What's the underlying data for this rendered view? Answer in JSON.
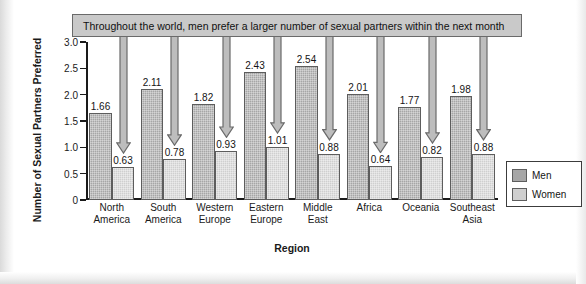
{
  "figure": {
    "callout_banner": "Throughout the world, men prefer a larger number of sexual partners within the next month",
    "legend_men": "Men",
    "legend_women": "Women"
  },
  "chart_data": {
    "type": "bar",
    "title": "Throughout the world, men prefer a larger number of sexual partners within the next month",
    "xlabel": "Region",
    "ylabel": "Number of Sexual Partners Preferred",
    "ylim": [
      0,
      3.0
    ],
    "yticks": [
      "0",
      "0.5",
      "1.0",
      "1.5",
      "2.0",
      "2.5",
      "3.0"
    ],
    "ytick_values": [
      0,
      0.5,
      1.0,
      1.5,
      2.0,
      2.5,
      3.0
    ],
    "grid": false,
    "legend_position": "right",
    "categories": [
      "North America",
      "South America",
      "Western Europe",
      "Eastern Europe",
      "Middle East",
      "Africa",
      "Oceania",
      "Southeast Asia"
    ],
    "category_lines": [
      [
        "North",
        "America"
      ],
      [
        "South",
        "America"
      ],
      [
        "Western",
        "Europe"
      ],
      [
        "Eastern",
        "Europe"
      ],
      [
        "Middle",
        "East"
      ],
      [
        "Africa",
        ""
      ],
      [
        "Oceania",
        ""
      ],
      [
        "Southeast",
        "Asia"
      ]
    ],
    "series": [
      {
        "name": "Men",
        "color": "#a6a6a6",
        "values": [
          1.66,
          2.11,
          1.82,
          2.43,
          2.54,
          2.01,
          1.77,
          1.98
        ],
        "labels": [
          "1.66",
          "2.11",
          "1.82",
          "2.43",
          "2.54",
          "2.01",
          "1.77",
          "1.98"
        ]
      },
      {
        "name": "Women",
        "color": "#cfcfcf",
        "values": [
          0.63,
          0.78,
          0.93,
          1.01,
          0.88,
          0.64,
          0.82,
          0.88
        ],
        "labels": [
          "0.63",
          "0.78",
          "0.93",
          "1.01",
          "0.88",
          "0.64",
          "0.82",
          "0.88"
        ]
      }
    ],
    "annotations": {
      "arrows_point_to": "women-bars",
      "arrow_count": 8
    }
  },
  "colors": {
    "men_bar": "#a6a6a6",
    "women_bar": "#cfcfcf",
    "banner_fill": "#c9c9c9",
    "outline": "#5d5d5d",
    "axis": "#1a1a1a"
  }
}
